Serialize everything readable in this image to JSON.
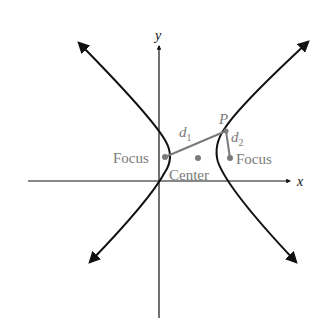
{
  "diagram": {
    "axes": {
      "x_label": "x",
      "y_label": "y"
    },
    "labels": {
      "focus_left": "Focus",
      "focus_right": "Focus",
      "center": "Center",
      "point": "P",
      "d1": "d",
      "d1_sub": "1",
      "d2": "d",
      "d2_sub": "2"
    },
    "colors": {
      "curve": "#111111",
      "axis": "#111111",
      "annotation": "#7a7a7a"
    }
  }
}
